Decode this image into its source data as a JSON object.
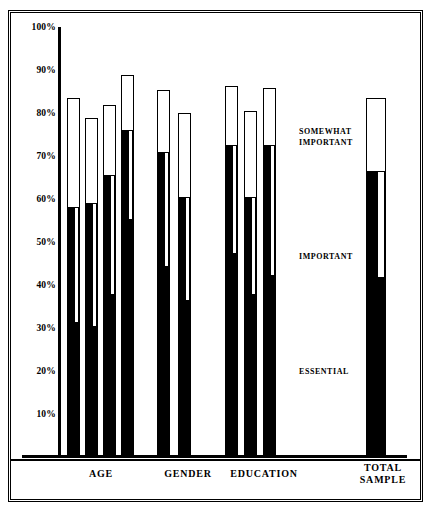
{
  "chart_data": {
    "type": "bar",
    "title": "",
    "subtitle": "",
    "xlabel": "",
    "ylabel": "",
    "ylim": [
      0,
      100
    ],
    "grid": false,
    "stacked": true,
    "legend_position": "inside-right",
    "y_ticks": [
      "100%",
      "90%",
      "80%",
      "70%",
      "60%",
      "50%",
      "40%",
      "30%",
      "20%",
      "10%"
    ],
    "y_tick_values": [
      100,
      90,
      80,
      70,
      60,
      50,
      40,
      30,
      20,
      10
    ],
    "legend": [
      {
        "key": "somewhat_important",
        "label": "SOMEWHAT\nIMPORTANT",
        "fill": "#ffffff"
      },
      {
        "key": "important",
        "label": "IMPORTANT",
        "fill": "#ffffff"
      },
      {
        "key": "essential",
        "label": "ESSENTIAL",
        "fill": "#000000"
      }
    ],
    "group_labels": [
      "AGE",
      "GENDER",
      "EDUCATION",
      "TOTAL\nSAMPLE"
    ],
    "series": [
      {
        "name": "ESSENTIAL",
        "values": [
          31,
          30,
          37.5,
          55,
          44,
          36,
          47,
          37.5,
          42,
          41.5
        ]
      },
      {
        "name": "IMPORTANT",
        "values": [
          27,
          29,
          28,
          21,
          27,
          24.5,
          25.5,
          23,
          30.5,
          25
        ]
      },
      {
        "name": "SOMEWHAT IMPORTANT",
        "values": [
          25.5,
          20,
          16.5,
          13,
          14.5,
          19.5,
          14,
          20,
          13.5,
          17
        ]
      }
    ],
    "bars": [
      {
        "group": "AGE",
        "total": 83.5,
        "cumulative_essential_important": 58,
        "essential": 31
      },
      {
        "group": "AGE",
        "total": 79,
        "cumulative_essential_important": 59,
        "essential": 30
      },
      {
        "group": "AGE",
        "total": 82,
        "cumulative_essential_important": 65.5,
        "essential": 37.5
      },
      {
        "group": "AGE",
        "total": 89,
        "cumulative_essential_important": 76,
        "essential": 55
      },
      {
        "group": "GENDER",
        "total": 85.5,
        "cumulative_essential_important": 71,
        "essential": 44
      },
      {
        "group": "GENDER",
        "total": 80,
        "cumulative_essential_important": 60.5,
        "essential": 36
      },
      {
        "group": "EDUCATION",
        "total": 86.5,
        "cumulative_essential_important": 72.5,
        "essential": 47
      },
      {
        "group": "EDUCATION",
        "total": 80.5,
        "cumulative_essential_important": 60.5,
        "essential": 37.5
      },
      {
        "group": "EDUCATION",
        "total": 86,
        "cumulative_essential_important": 72.5,
        "essential": 42
      },
      {
        "group": "TOTAL SAMPLE",
        "total": 83.5,
        "cumulative_essential_important": 66.5,
        "essential": 41.5
      }
    ]
  },
  "axis": {
    "tick_100": "100%",
    "tick_90": "90%",
    "tick_80": "80%",
    "tick_70": "70%",
    "tick_60": "60%",
    "tick_50": "50%",
    "tick_40": "40%",
    "tick_30": "30%",
    "tick_20": "20%",
    "tick_10": "10%"
  },
  "legend": {
    "somewhat_important": "SOMEWHAT\nIMPORTANT",
    "important": "IMPORTANT",
    "essential": "ESSENTIAL"
  },
  "categories": {
    "age": "AGE",
    "gender": "GENDER",
    "education": "EDUCATION",
    "total_sample": "TOTAL\nSAMPLE"
  },
  "colors": {
    "essential_fill": "#000000",
    "bar_outline": "#000000",
    "background": "#ffffff",
    "text": "#000000"
  }
}
